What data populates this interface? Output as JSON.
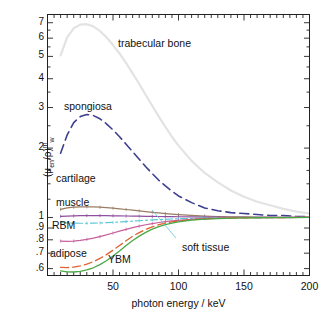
{
  "chart_data": {
    "type": "line",
    "title": "",
    "xlabel": "photon energy / keV",
    "ylabel": "(μ_en/ρ)^m_w",
    "ylabel_parts": {
      "open": "(",
      "mu": "μ",
      "sub_en": "en",
      "slash": "/ρ",
      "close": ")",
      "sup_m": "m",
      "sub_w": "w"
    },
    "xlim": [
      0,
      200
    ],
    "ylim": [
      0.56,
      7.6
    ],
    "yscale": "log",
    "xscale": "linear",
    "grid": false,
    "legend_position": "inline-labels",
    "xticks_labeled": [
      50,
      100,
      150,
      200
    ],
    "yticks_labeled": [
      ".6",
      ".7",
      ".8",
      ".9",
      "1",
      "2",
      "3",
      "4",
      "5",
      "6",
      "7"
    ],
    "yticks_values": [
      0.6,
      0.7,
      0.8,
      0.9,
      1,
      2,
      3,
      4,
      5,
      6,
      7
    ],
    "series": [
      {
        "name": "trabecular bone",
        "color": "#e3e3e3",
        "dash": "none",
        "width": 2.2,
        "label_x": 118,
        "label_y": 37,
        "x": [
          10,
          15,
          20,
          25,
          30,
          35,
          40,
          45,
          50,
          55,
          60,
          65,
          70,
          75,
          80,
          85,
          90,
          95,
          100,
          110,
          120,
          130,
          140,
          150,
          160,
          170,
          180,
          190,
          200
        ],
        "y": [
          5.05,
          6.05,
          6.62,
          6.87,
          6.9,
          6.75,
          6.45,
          6.05,
          5.6,
          5.15,
          4.68,
          4.22,
          3.8,
          3.4,
          3.05,
          2.74,
          2.47,
          2.24,
          2.05,
          1.76,
          1.56,
          1.42,
          1.31,
          1.23,
          1.17,
          1.13,
          1.09,
          1.06,
          1.04
        ]
      },
      {
        "name": "spongiosa",
        "color": "#3d3f8f",
        "dash": "9,5",
        "width": 1.6,
        "label_x": 64,
        "label_y": 100,
        "x": [
          10,
          15,
          20,
          25,
          30,
          35,
          40,
          45,
          50,
          55,
          60,
          65,
          70,
          75,
          80,
          85,
          90,
          95,
          100,
          110,
          120,
          130,
          140,
          150,
          160,
          170,
          180,
          190,
          200
        ],
        "y": [
          1.9,
          2.28,
          2.58,
          2.74,
          2.8,
          2.77,
          2.68,
          2.55,
          2.4,
          2.24,
          2.08,
          1.93,
          1.79,
          1.66,
          1.55,
          1.45,
          1.37,
          1.3,
          1.24,
          1.16,
          1.1,
          1.07,
          1.05,
          1.04,
          1.03,
          1.02,
          1.02,
          1.01,
          1.01
        ]
      },
      {
        "name": "cartilage",
        "color": "#9a7b63",
        "dash": "none",
        "width": 1.2,
        "label_x": 56,
        "label_y": 172,
        "x": [
          10,
          15,
          20,
          25,
          30,
          35,
          40,
          45,
          50,
          55,
          60,
          65,
          70,
          75,
          80,
          85,
          90,
          95,
          100,
          110,
          120,
          130,
          140,
          150,
          160,
          170,
          180,
          190,
          200
        ],
        "y": [
          1.085,
          1.1,
          1.108,
          1.112,
          1.113,
          1.111,
          1.108,
          1.103,
          1.097,
          1.09,
          1.083,
          1.076,
          1.068,
          1.06,
          1.053,
          1.046,
          1.04,
          1.034,
          1.029,
          1.021,
          1.014,
          1.01,
          1.007,
          1.005,
          1.004,
          1.003,
          1.002,
          1.002,
          1.001
        ]
      },
      {
        "name": "muscle",
        "color": "#8e4f9e",
        "dash": "none",
        "width": 1.2,
        "label_x": 56,
        "label_y": 196,
        "x": [
          10,
          15,
          20,
          25,
          30,
          35,
          40,
          45,
          50,
          55,
          60,
          65,
          70,
          75,
          80,
          85,
          90,
          95,
          100,
          110,
          120,
          130,
          140,
          150,
          160,
          170,
          180,
          190,
          200
        ],
        "y": [
          1.012,
          1.014,
          1.016,
          1.018,
          1.019,
          1.019,
          1.019,
          1.018,
          1.017,
          1.016,
          1.015,
          1.014,
          1.013,
          1.012,
          1.011,
          1.01,
          1.009,
          1.008,
          1.007,
          1.005,
          1.004,
          1.003,
          1.002,
          1.002,
          1.001,
          1.001,
          1.001,
          1.0,
          1.0
        ]
      },
      {
        "name": "soft tissue",
        "color": "#5ec8d8",
        "dash": "7,3,2,3",
        "width": 1.2,
        "label_x": 182,
        "label_y": 241,
        "leader": {
          "x1": 176,
          "y1": 238,
          "x2": 152,
          "y2": 210,
          "color": "#5ec8d8"
        },
        "x": [
          10,
          15,
          20,
          25,
          30,
          35,
          40,
          45,
          50,
          55,
          60,
          65,
          70,
          75,
          80,
          85,
          90,
          95,
          100,
          110,
          120,
          130,
          140,
          150,
          160,
          170,
          180,
          190,
          200
        ],
        "y": [
          0.952,
          0.948,
          0.945,
          0.944,
          0.944,
          0.945,
          0.947,
          0.949,
          0.952,
          0.956,
          0.96,
          0.964,
          0.968,
          0.972,
          0.976,
          0.979,
          0.982,
          0.985,
          0.987,
          0.991,
          0.994,
          0.996,
          0.997,
          0.998,
          0.999,
          0.999,
          1.0,
          1.0,
          1.0
        ]
      },
      {
        "name": "RBM",
        "color": "#c7609c",
        "dash": "none",
        "width": 1.2,
        "label_x": 52,
        "label_y": 219,
        "x": [
          10,
          15,
          20,
          25,
          30,
          35,
          40,
          45,
          50,
          55,
          60,
          65,
          70,
          75,
          80,
          85,
          90,
          95,
          100,
          110,
          120,
          130,
          140,
          150,
          160,
          170,
          180,
          190,
          200
        ],
        "y": [
          0.79,
          0.788,
          0.79,
          0.795,
          0.803,
          0.813,
          0.826,
          0.84,
          0.856,
          0.872,
          0.888,
          0.903,
          0.917,
          0.93,
          0.941,
          0.951,
          0.959,
          0.966,
          0.972,
          0.981,
          0.988,
          0.992,
          0.995,
          0.997,
          0.998,
          0.999,
          0.999,
          1.0,
          1.0
        ]
      },
      {
        "name": "adipose",
        "color": "#e0622f",
        "dash": "8,4",
        "width": 1.3,
        "label_x": 50,
        "label_y": 247,
        "x": [
          10,
          15,
          20,
          25,
          30,
          35,
          40,
          45,
          50,
          55,
          60,
          65,
          70,
          75,
          80,
          85,
          90,
          95,
          100,
          110,
          120,
          130,
          140,
          150,
          160,
          170,
          180,
          190,
          200
        ],
        "y": [
          0.607,
          0.606,
          0.609,
          0.616,
          0.627,
          0.643,
          0.664,
          0.69,
          0.721,
          0.756,
          0.793,
          0.828,
          0.86,
          0.888,
          0.911,
          0.93,
          0.945,
          0.957,
          0.966,
          0.979,
          0.987,
          0.992,
          0.995,
          0.997,
          0.998,
          0.999,
          0.999,
          1.0,
          1.0
        ]
      },
      {
        "name": "YBM",
        "color": "#4aa844",
        "dash": "none",
        "width": 1.3,
        "label_x": 108,
        "label_y": 253,
        "x": [
          10,
          15,
          20,
          25,
          30,
          35,
          40,
          45,
          50,
          55,
          60,
          65,
          70,
          75,
          80,
          85,
          90,
          95,
          100,
          110,
          120,
          130,
          140,
          150,
          160,
          170,
          180,
          190,
          200
        ],
        "y": [
          0.586,
          0.581,
          0.58,
          0.584,
          0.592,
          0.605,
          0.624,
          0.649,
          0.68,
          0.716,
          0.755,
          0.794,
          0.83,
          0.862,
          0.89,
          0.913,
          0.931,
          0.946,
          0.957,
          0.973,
          0.983,
          0.989,
          0.993,
          0.996,
          0.997,
          0.998,
          0.999,
          0.999,
          1.0
        ]
      }
    ]
  }
}
